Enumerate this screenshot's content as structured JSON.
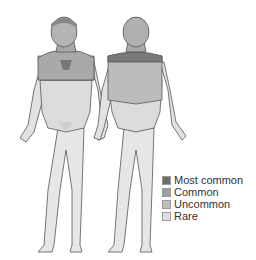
{
  "figure": {
    "views": [
      {
        "name": "front",
        "label": "Front view"
      },
      {
        "name": "back",
        "label": "Back view"
      }
    ],
    "colors": {
      "most_common": "#6e6e6e",
      "common": "#9e9e9e",
      "uncommon": "#bdbdbd",
      "rare": "#dedede",
      "outline": "#555555"
    }
  },
  "legend": {
    "items": [
      {
        "label": "Most common",
        "color": "#6e6e6e"
      },
      {
        "label": "Common",
        "color": "#9e9e9e"
      },
      {
        "label": "Uncommon",
        "color": "#bdbdbd"
      },
      {
        "label": "Rare",
        "color": "#dedede"
      }
    ]
  }
}
